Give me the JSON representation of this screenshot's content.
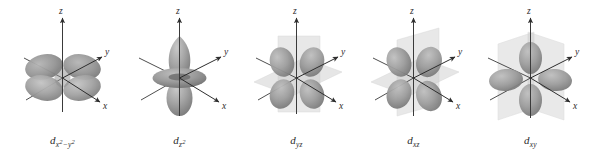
{
  "figure": {
    "background_color": "#ffffff",
    "orbital_fill": "#9a9a9a",
    "orbital_fill_dark": "#7e7e7e",
    "orbital_fill_light": "#b8b8b8",
    "plane_fill": "#c9c9c9",
    "axis_color": "#2e2e2e",
    "label_color": "#2b2b2b"
  },
  "orbitals": [
    {
      "id": "dx2-y2",
      "name": "d-x2-y2-orbital",
      "label_base": "d",
      "label_sub_main": "x",
      "label_sub_sup1": "2",
      "label_sub_mid": "−y",
      "label_sub_sup2": "2",
      "lobe_count": 4,
      "lobe_orientation": "along-x-and-y-axes",
      "planes": [],
      "axes": [
        {
          "name": "z",
          "label": "z",
          "direction": "up"
        },
        {
          "name": "y",
          "label": "y",
          "direction": "upper-right"
        },
        {
          "name": "x",
          "label": "x",
          "direction": "lower-right"
        }
      ]
    },
    {
      "id": "dz2",
      "name": "d-z2-orbital",
      "label_base": "d",
      "label_sub_main": "z",
      "label_sub_sup1": "2",
      "label_sub_mid": "",
      "label_sub_sup2": "",
      "lobe_count": 2,
      "lobe_orientation": "along-z-axis-with-torus",
      "planes": [],
      "axes": [
        {
          "name": "z",
          "label": "z",
          "direction": "up"
        },
        {
          "name": "y",
          "label": "y",
          "direction": "upper-right"
        },
        {
          "name": "x",
          "label": "x",
          "direction": "lower-right"
        }
      ]
    },
    {
      "id": "dyz",
      "name": "d-yz-orbital",
      "label_base": "d",
      "label_sub_main": "yz",
      "label_sub_sup1": "",
      "label_sub_mid": "",
      "label_sub_sup2": "",
      "lobe_count": 4,
      "lobe_orientation": "between-y-and-z-axes",
      "planes": [
        "horizontal-xy-plane",
        "vertical-xz-plane"
      ],
      "axes": [
        {
          "name": "z",
          "label": "z",
          "direction": "up"
        },
        {
          "name": "y",
          "label": "y",
          "direction": "upper-right"
        },
        {
          "name": "x",
          "label": "x",
          "direction": "lower-right"
        }
      ]
    },
    {
      "id": "dxz",
      "name": "d-xz-orbital",
      "label_base": "d",
      "label_sub_main": "xz",
      "label_sub_sup1": "",
      "label_sub_mid": "",
      "label_sub_sup2": "",
      "lobe_count": 4,
      "lobe_orientation": "between-x-and-z-axes",
      "planes": [
        "horizontal-xy-plane",
        "vertical-yz-plane"
      ],
      "axes": [
        {
          "name": "z",
          "label": "z",
          "direction": "up"
        },
        {
          "name": "y",
          "label": "y",
          "direction": "upper-right"
        },
        {
          "name": "x",
          "label": "x",
          "direction": "lower-right"
        }
      ]
    },
    {
      "id": "dxy",
      "name": "d-xy-orbital",
      "label_base": "d",
      "label_sub_main": "xy",
      "label_sub_sup1": "",
      "label_sub_mid": "",
      "label_sub_sup2": "",
      "lobe_count": 4,
      "lobe_orientation": "between-x-and-y-axes",
      "planes": [
        "vertical-xz-plane",
        "vertical-yz-plane"
      ],
      "axes": [
        {
          "name": "z",
          "label": "z",
          "direction": "up"
        },
        {
          "name": "y",
          "label": "y",
          "direction": "upper-right"
        },
        {
          "name": "x",
          "label": "x",
          "direction": "lower-right"
        }
      ]
    }
  ]
}
